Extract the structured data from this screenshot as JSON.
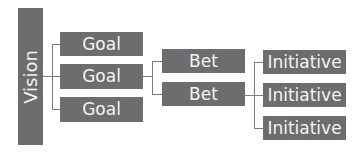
{
  "diagram": {
    "vision": {
      "label": "Vision"
    },
    "goals": [
      {
        "label": "Goal"
      },
      {
        "label": "Goal"
      },
      {
        "label": "Goal"
      }
    ],
    "bets": [
      {
        "label": "Bet"
      },
      {
        "label": "Bet"
      }
    ],
    "initiatives": [
      {
        "label": "Initiative"
      },
      {
        "label": "Initiative"
      },
      {
        "label": "Initiative"
      }
    ],
    "colors": {
      "box_fill": "#6d6d6d",
      "box_text": "#f4f4f4",
      "connector": "#7a7a7a"
    }
  }
}
